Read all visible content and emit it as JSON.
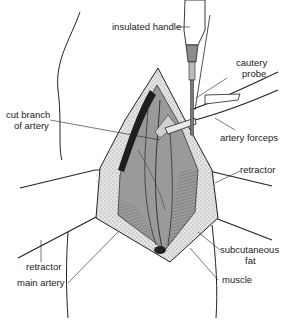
{
  "figure": {
    "labels": {
      "insulated_handle": "insulated handle",
      "cautery_probe_1": "cautery",
      "cautery_probe_2": "probe",
      "cut_branch_1": "cut branch",
      "cut_branch_2": "of artery",
      "artery_forceps": "artery forceps",
      "retractor_right": "retractor",
      "retractor_left": "retractor",
      "subcutaneous_1": "subcutaneous",
      "subcutaneous_2": "fat",
      "main_artery": "main artery",
      "muscle": "muscle"
    },
    "colors": {
      "line": "#222222",
      "tissue_dark": "#6a6a6a",
      "tissue_mid": "#9a9a9a",
      "fat": "#d6d6d6",
      "instrument": "#8c8c8c"
    }
  }
}
